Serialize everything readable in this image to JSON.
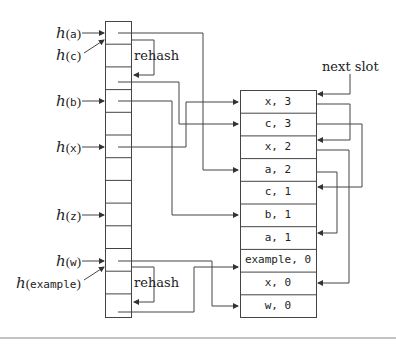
{
  "diagram": {
    "hash_labels": [
      {
        "fn": "h",
        "arg": "a"
      },
      {
        "fn": "h",
        "arg": "c"
      },
      {
        "fn": "h",
        "arg": "b"
      },
      {
        "fn": "h",
        "arg": "x"
      },
      {
        "fn": "h",
        "arg": "z"
      },
      {
        "fn": "h",
        "arg": "w"
      },
      {
        "fn": "h",
        "arg": "example"
      }
    ],
    "rehash_label_top": "rehash",
    "rehash_label_bottom": "rehash",
    "next_slot_label": "next slot",
    "entries": [
      "x, 3",
      "c, 3",
      "x, 2",
      "a, 2",
      "c, 1",
      "b, 1",
      "a, 1",
      "example, 0",
      "x, 0",
      "w, 0"
    ],
    "table_rows": 13
  }
}
